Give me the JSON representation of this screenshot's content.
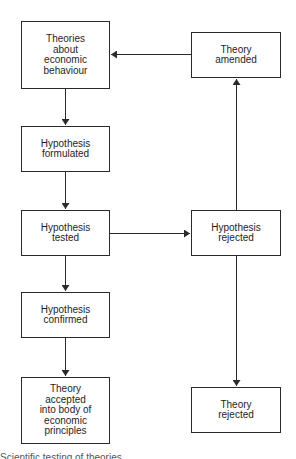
{
  "diagram": {
    "type": "flowchart",
    "line_color": "#2a2a2a",
    "text_color": "#1e1e1e",
    "background": "#ffffff",
    "nodes": [
      {
        "id": "theories",
        "label": "Theories\nabout\neconomic\nbehaviour"
      },
      {
        "id": "formulated",
        "label": "Hypothesis\nformulated"
      },
      {
        "id": "tested",
        "label": "Hypothesis\ntested"
      },
      {
        "id": "confirmed",
        "label": "Hypothesis\nconfirmed"
      },
      {
        "id": "accepted",
        "label": "Theory\naccepted\ninto body of\neconomic\nprinciples"
      },
      {
        "id": "amended",
        "label": "Theory\namended"
      },
      {
        "id": "hyp_rejected",
        "label": "Hypothesis\nrejected"
      },
      {
        "id": "theory_rejected",
        "label": "Theory\nrejected"
      }
    ],
    "edges": [
      {
        "from": "theories",
        "to": "formulated"
      },
      {
        "from": "formulated",
        "to": "tested"
      },
      {
        "from": "tested",
        "to": "confirmed"
      },
      {
        "from": "confirmed",
        "to": "accepted"
      },
      {
        "from": "tested",
        "to": "hyp_rejected"
      },
      {
        "from": "hyp_rejected",
        "to": "amended"
      },
      {
        "from": "amended",
        "to": "theories"
      },
      {
        "from": "hyp_rejected",
        "to": "theory_rejected"
      }
    ],
    "caption": "Scientific testing of theories"
  }
}
